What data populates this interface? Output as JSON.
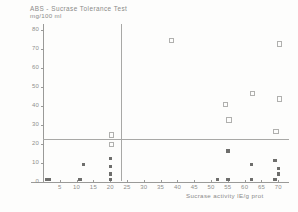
{
  "chart_data": {
    "type": "scatter",
    "title": "ABS - Sucrase Tolerance Test",
    "subtitle": "mg/100 ml",
    "ylabel": "mg/100 ml",
    "xlabel": "Sucrase activity  IE/g prot",
    "xlim": [
      0,
      72
    ],
    "ylim": [
      0,
      82
    ],
    "xticks": [
      5,
      10,
      15,
      20,
      25,
      30,
      35,
      40,
      45,
      50,
      55,
      60,
      65,
      70
    ],
    "yticks": [
      0,
      10,
      20,
      30,
      40,
      50,
      60,
      70,
      80
    ],
    "grid": false,
    "legend": null,
    "reference_lines": [
      {
        "orientation": "horizontal",
        "value": 20
      },
      {
        "orientation": "vertical",
        "value": 25
      }
    ],
    "series": [
      {
        "name": "low response (filled)",
        "marker": "filled-square",
        "points": [
          {
            "x": 1,
            "y": 1
          },
          {
            "x": 2,
            "y": 1
          },
          {
            "x": 11,
            "y": 1
          },
          {
            "x": 20,
            "y": 1
          },
          {
            "x": 20,
            "y": 4
          },
          {
            "x": 20,
            "y": 8
          },
          {
            "x": 12,
            "y": 9
          },
          {
            "x": 20,
            "y": 12
          },
          {
            "x": 52,
            "y": 1
          },
          {
            "x": 55,
            "y": 1
          },
          {
            "x": 62,
            "y": 1
          },
          {
            "x": 69,
            "y": 1
          },
          {
            "x": 70,
            "y": 4
          },
          {
            "x": 70,
            "y": 7
          },
          {
            "x": 69,
            "y": 11
          },
          {
            "x": 62,
            "y": 9
          },
          {
            "x": 55,
            "y": 16
          }
        ]
      },
      {
        "name": "normal response (open)",
        "marker": "open-square",
        "points": [
          {
            "x": 20,
            "y": 20
          },
          {
            "x": 20,
            "y": 25
          },
          {
            "x": 38,
            "y": 75
          },
          {
            "x": 70,
            "y": 73
          },
          {
            "x": 54,
            "y": 41
          },
          {
            "x": 62,
            "y": 47
          },
          {
            "x": 70,
            "y": 44
          },
          {
            "x": 55,
            "y": 33
          },
          {
            "x": 69,
            "y": 27
          }
        ]
      }
    ]
  }
}
